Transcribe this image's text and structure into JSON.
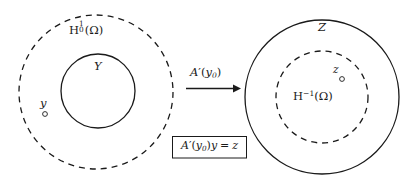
{
  "figure": {
    "background_color": "#ffffff",
    "stroke_color": "#1a1a1a",
    "text_color": "#1a1a1a"
  },
  "left_domain": {
    "outer_set_label": "H",
    "outer_set_sup": "1",
    "outer_set_sub": "0",
    "outer_set_arg": "(Ω)",
    "outer_set_full": "H₀¹(Ω)",
    "outer_style": "dashed",
    "inner_set_label": "Y",
    "inner_style": "solid",
    "point_label": "y",
    "point_marker": "open-circle"
  },
  "map": {
    "arrow_label_main": "A",
    "arrow_label_prime": "′",
    "arrow_label_arg_open": "(",
    "arrow_label_var": "y",
    "arrow_label_var_sub": "0",
    "arrow_label_arg_close": ")",
    "arrow_label_full": "A′(y₀)",
    "arrow_direction": "right",
    "equation_lhs_op": "A",
    "equation_prime": "′",
    "equation_arg_open": "(",
    "equation_arg_var": "y",
    "equation_arg_sub": "0",
    "equation_arg_close": ")",
    "equation_operand": "y",
    "equation_equals": "=",
    "equation_rhs": "z",
    "equation_full": "A′(y₀)y = z"
  },
  "right_domain": {
    "outer_set_label": "Z",
    "outer_style": "solid",
    "inner_set_label": "H",
    "inner_set_sup": "−1",
    "inner_set_arg": "(Ω)",
    "inner_set_full": "H⁻¹(Ω)",
    "inner_style": "dashed",
    "point_label": "z",
    "point_marker": "open-circle"
  }
}
